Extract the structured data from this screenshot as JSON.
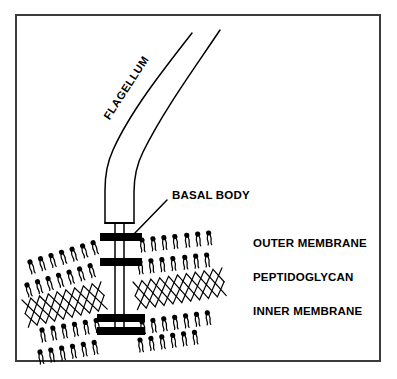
{
  "diagram": {
    "background_color": "#ffffff",
    "ink_color": "#000000",
    "frame_color": "#3a3a3a"
  },
  "labels": {
    "flagellum": "FLAGELLUM",
    "basal_body": "BASAL BODY",
    "outer_membrane": "OUTER MEMBRANE",
    "peptidoglycan": "PEPTIDOGLYCAN",
    "inner_membrane": "INNER MEMBRANE"
  },
  "structures": {
    "flagellum_filament": {
      "kind": "open-ended-tube",
      "description": "two curved parallel lines running from upper right down to the hook"
    },
    "hook": {
      "kind": "vertical-box",
      "description": "straightened widened base of the filament closed by a horizontal line"
    },
    "rod": {
      "kind": "double-line-shaft",
      "description": "narrow two-line rod descending from the hook through all rings"
    },
    "rings": [
      {
        "name": "L-ring",
        "layer": "outer-membrane",
        "y": 237
      },
      {
        "name": "P-ring",
        "layer": "peptidoglycan-top",
        "y": 262
      },
      {
        "name": "MS-ring",
        "layer": "inner-membrane",
        "y": 318
      },
      {
        "name": "C-ring",
        "layer": "cytoplasm",
        "y": 330
      }
    ],
    "outer_membrane": {
      "kind": "phospholipid-bilayer",
      "description": "two opposed rows of circular-head two-tail phospholipids, tilted"
    },
    "peptidoglycan": {
      "kind": "crosshatch-mesh",
      "description": "zigzag lattice of crossing strands, tilted"
    },
    "inner_membrane": {
      "kind": "phospholipid-bilayer",
      "description": "two opposed rows of circular-head two-tail phospholipids, tilted"
    }
  }
}
